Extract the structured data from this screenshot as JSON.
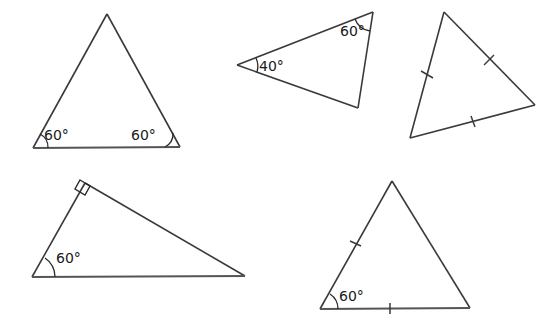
{
  "figure": {
    "background_color": "#ffffff",
    "stroke_color": "#3a3a3a",
    "text_color": "#1a1a1a",
    "width": 560,
    "height": 326
  },
  "shapes": [
    {
      "id": "triangle-1",
      "position": "top-left",
      "vertices": [
        [
          107,
          14
        ],
        [
          33,
          148
        ],
        [
          180,
          147
        ]
      ],
      "angle_labels": [
        {
          "text": "60°",
          "x": 44,
          "y": 140,
          "vertex": "bottom-left"
        },
        {
          "text": "60°",
          "x": 131,
          "y": 140,
          "vertex": "bottom-right"
        }
      ],
      "tick_marks": [],
      "right_angle": false
    },
    {
      "id": "triangle-2",
      "position": "top-middle",
      "vertices": [
        [
          237,
          65
        ],
        [
          373,
          12
        ],
        [
          358,
          108
        ]
      ],
      "angle_labels": [
        {
          "text": "40°",
          "x": 259,
          "y": 71,
          "vertex": "left"
        },
        {
          "text": "60°",
          "x": 340,
          "y": 36,
          "vertex": "top-right"
        }
      ],
      "tick_marks": [],
      "right_angle": false
    },
    {
      "id": "triangle-3",
      "position": "top-right",
      "vertices": [
        [
          444,
          12
        ],
        [
          410,
          138
        ],
        [
          535,
          105
        ]
      ],
      "angle_labels": [],
      "tick_marks": [
        {
          "side": "left",
          "count": 1
        },
        {
          "side": "right",
          "count": 1
        },
        {
          "side": "bottom",
          "count": 1
        }
      ],
      "right_angle": false
    },
    {
      "id": "triangle-4",
      "position": "bottom-left",
      "vertices": [
        [
          85,
          183
        ],
        [
          32,
          277
        ],
        [
          245,
          276
        ]
      ],
      "angle_labels": [
        {
          "text": "60°",
          "x": 56,
          "y": 263,
          "vertex": "bottom-left"
        }
      ],
      "tick_marks": [],
      "right_angle": true,
      "right_angle_vertex": "top"
    },
    {
      "id": "triangle-5",
      "position": "bottom-right",
      "vertices": [
        [
          392,
          181
        ],
        [
          320,
          309
        ],
        [
          470,
          308
        ]
      ],
      "angle_labels": [
        {
          "text": "60°",
          "x": 339,
          "y": 301,
          "vertex": "bottom-left"
        }
      ],
      "tick_marks": [
        {
          "side": "left",
          "count": 1
        },
        {
          "side": "bottom",
          "count": 1
        }
      ],
      "right_angle": false
    }
  ],
  "labels": {
    "t1_left_angle": "60°",
    "t1_right_angle": "60°",
    "t2_left_angle": "40°",
    "t2_top_angle": "60°",
    "t4_left_angle": "60°",
    "t5_left_angle": "60°"
  }
}
